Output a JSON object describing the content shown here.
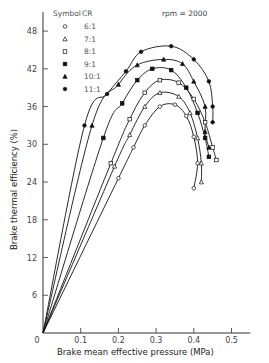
{
  "chart_data": {
    "type": "line",
    "title": "",
    "annotation": "rpm = 2000",
    "xlabel": "Brake mean effective pressure (MPa)",
    "ylabel": "Brake thermal efficiency (%)",
    "xlim": [
      0,
      0.55
    ],
    "ylim": [
      0,
      50
    ],
    "xticks": [
      0,
      0.1,
      0.2,
      0.3,
      0.4,
      0.5
    ],
    "xtick_labels": [
      "0",
      "0.1",
      "0.2",
      "0.3",
      "0.4",
      "0.5"
    ],
    "yticks": [
      0,
      6,
      12,
      18,
      24,
      30,
      36,
      42,
      48
    ],
    "ytick_labels": [
      "",
      "6",
      "12",
      "18",
      "24",
      "30",
      "36",
      "42",
      "48"
    ],
    "grid": false,
    "legend": {
      "title_symbol": "Symbol",
      "title_cr": "CR",
      "position": "upper-left",
      "entries": [
        {
          "marker": "open-circle",
          "label": "6:1"
        },
        {
          "marker": "open-triangle",
          "label": "7:1"
        },
        {
          "marker": "open-square",
          "label": "8:1"
        },
        {
          "marker": "filled-square",
          "label": "9:1"
        },
        {
          "marker": "filled-triangle",
          "label": "10:1"
        },
        {
          "marker": "filled-circle",
          "label": "11:1"
        }
      ]
    },
    "series": [
      {
        "name": "6:1",
        "marker": "open-circle",
        "points": [
          [
            0,
            0
          ],
          [
            0.2,
            24.6
          ],
          [
            0.24,
            29.5
          ],
          [
            0.27,
            33.0
          ],
          [
            0.31,
            36.0
          ],
          [
            0.35,
            36.3
          ],
          [
            0.38,
            34.5
          ],
          [
            0.4,
            31.2
          ],
          [
            0.41,
            27.0
          ],
          [
            0.4,
            23.0
          ]
        ]
      },
      {
        "name": "7:1",
        "marker": "open-triangle",
        "points": [
          [
            0,
            0
          ],
          [
            0.19,
            26.5
          ],
          [
            0.23,
            31.5
          ],
          [
            0.27,
            36.0
          ],
          [
            0.31,
            38.2
          ],
          [
            0.36,
            37.6
          ],
          [
            0.39,
            35.0
          ],
          [
            0.41,
            31.0
          ],
          [
            0.42,
            27.0
          ],
          [
            0.42,
            24.0
          ]
        ]
      },
      {
        "name": "8:1",
        "marker": "open-square",
        "points": [
          [
            0,
            0
          ],
          [
            0.18,
            27.0
          ],
          [
            0.23,
            34.0
          ],
          [
            0.27,
            38.2
          ],
          [
            0.31,
            40.2
          ],
          [
            0.36,
            39.8
          ],
          [
            0.4,
            37.2
          ],
          [
            0.43,
            33.5
          ],
          [
            0.45,
            29.5
          ],
          [
            0.46,
            27.5
          ]
        ]
      },
      {
        "name": "9:1",
        "marker": "filled-square",
        "points": [
          [
            0,
            0
          ],
          [
            0.16,
            31.0
          ],
          [
            0.21,
            36.5
          ],
          [
            0.25,
            40.2
          ],
          [
            0.29,
            42.0
          ],
          [
            0.34,
            41.8
          ],
          [
            0.38,
            39.0
          ],
          [
            0.41,
            35.0
          ],
          [
            0.43,
            31.0
          ],
          [
            0.44,
            28.0
          ]
        ]
      },
      {
        "name": "10:1",
        "marker": "filled-triangle",
        "points": [
          [
            0,
            0
          ],
          [
            0.13,
            33.0
          ],
          [
            0.2,
            39.5
          ],
          [
            0.25,
            42.6
          ],
          [
            0.32,
            43.5
          ],
          [
            0.37,
            42.8
          ],
          [
            0.4,
            40.0
          ],
          [
            0.43,
            36.0
          ],
          [
            0.43,
            32.0
          ],
          [
            0.44,
            29.5
          ]
        ]
      },
      {
        "name": "11:1",
        "marker": "filled-circle",
        "points": [
          [
            0,
            0
          ],
          [
            0.11,
            33.0
          ],
          [
            0.17,
            38.0
          ],
          [
            0.22,
            41.6
          ],
          [
            0.26,
            44.7
          ],
          [
            0.34,
            45.6
          ],
          [
            0.4,
            43.5
          ],
          [
            0.44,
            40.0
          ],
          [
            0.45,
            36.0
          ],
          [
            0.45,
            33.5
          ]
        ]
      }
    ]
  }
}
